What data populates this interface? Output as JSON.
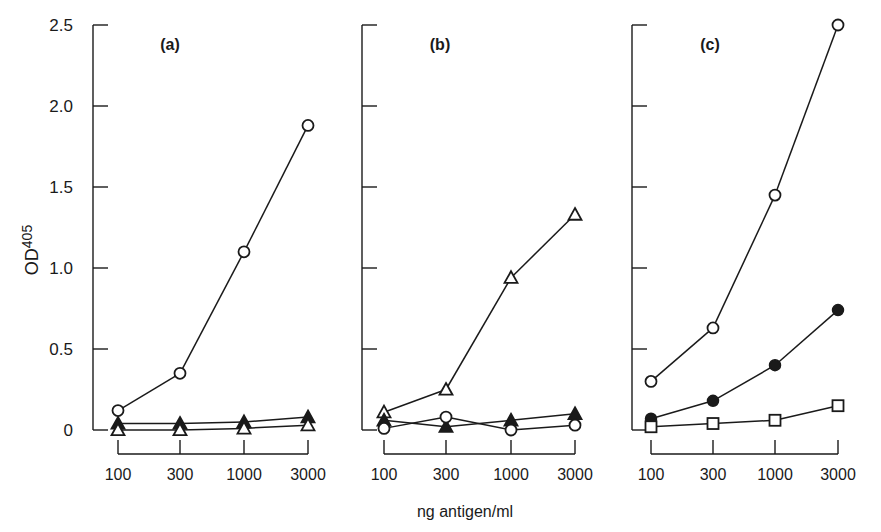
{
  "figure": {
    "xlabel": "ng antigen/ml",
    "ylabel_main": "OD",
    "ylabel_sub": "405",
    "ink_color": "#1a1a1a",
    "background": "#ffffff"
  },
  "chart_data": [
    {
      "type": "line",
      "title": "(a)",
      "xlabel": "ng antigen/ml",
      "ylabel": "OD405",
      "ylim": [
        0,
        2.5
      ],
      "yticks": [
        "0",
        "0.5",
        "1.0",
        "1.5",
        "2.0",
        "2.5"
      ],
      "x_scale": "categorical-log",
      "categories": [
        "100",
        "300",
        "1000",
        "3000"
      ],
      "grid": false,
      "series": [
        {
          "name": "open circle",
          "marker": "open-circle",
          "values": [
            0.12,
            0.35,
            1.1,
            1.88
          ]
        },
        {
          "name": "filled triangle",
          "marker": "filled-triangle",
          "values": [
            0.04,
            0.04,
            0.05,
            0.08
          ]
        },
        {
          "name": "open triangle",
          "marker": "open-triangle",
          "values": [
            0.0,
            0.0,
            0.01,
            0.03
          ]
        }
      ]
    },
    {
      "type": "line",
      "title": "(b)",
      "xlabel": "ng antigen/ml",
      "ylabel": "OD405",
      "ylim": [
        0,
        2.5
      ],
      "x_scale": "categorical-log",
      "categories": [
        "100",
        "300",
        "1000",
        "3000"
      ],
      "grid": false,
      "series": [
        {
          "name": "open triangle",
          "marker": "open-triangle",
          "values": [
            0.11,
            0.25,
            0.94,
            1.33
          ]
        },
        {
          "name": "filled triangle",
          "marker": "filled-triangle",
          "values": [
            0.06,
            0.02,
            0.06,
            0.1
          ]
        },
        {
          "name": "open circle",
          "marker": "open-circle",
          "values": [
            0.01,
            0.08,
            0.0,
            0.03
          ]
        }
      ]
    },
    {
      "type": "line",
      "title": "(c)",
      "xlabel": "ng antigen/ml",
      "ylabel": "OD405",
      "ylim": [
        0,
        2.5
      ],
      "x_scale": "categorical-log",
      "categories": [
        "100",
        "300",
        "1000",
        "3000"
      ],
      "grid": false,
      "series": [
        {
          "name": "open circle",
          "marker": "open-circle",
          "values": [
            0.3,
            0.63,
            1.45,
            2.5
          ]
        },
        {
          "name": "filled circle",
          "marker": "filled-circle",
          "values": [
            0.07,
            0.18,
            0.4,
            0.74
          ]
        },
        {
          "name": "open square",
          "marker": "open-square",
          "values": [
            0.02,
            0.04,
            0.06,
            0.15
          ]
        }
      ]
    }
  ]
}
